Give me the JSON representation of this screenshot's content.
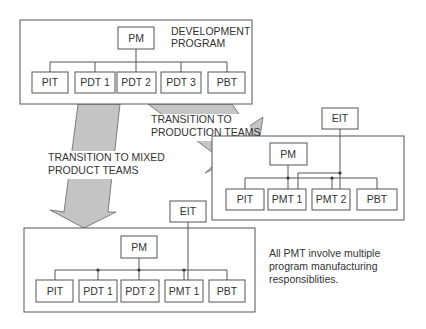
{
  "diagram": {
    "development_program": {
      "title_line1": "DEVELOPMENT",
      "title_line2": "PROGRAM",
      "manager": "PM",
      "teams": [
        "PIT",
        "PDT 1",
        "PDT 2",
        "PDT 3",
        "PBT"
      ]
    },
    "arrow_mixed": {
      "line1": "TRANSITION TO MIXED",
      "line2": "PRODUCT TEAMS"
    },
    "arrow_production": {
      "line1": "TRANSITION TO",
      "line2": "PRODUCTION TEAMS"
    },
    "production_teams": {
      "external": "EIT",
      "manager": "PM",
      "teams": [
        "PIT",
        "PMT 1",
        "PMT 2",
        "PBT"
      ]
    },
    "mixed_product_teams": {
      "external": "EIT",
      "manager": "PM",
      "teams": [
        "PIT",
        "PDT 1",
        "PDT 2",
        "PMT 1",
        "PBT"
      ]
    },
    "note": {
      "line1": "All PMT involve multiple",
      "line2": "program manufacturing",
      "line3": "responsiblities."
    }
  }
}
